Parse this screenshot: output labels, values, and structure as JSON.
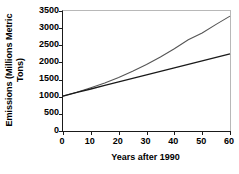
{
  "chart_data": {
    "type": "line",
    "title": "",
    "xlabel": "Years after 1990",
    "ylabel_line1": "Emissions (Millions Metric",
    "ylabel_line2": "Tons)",
    "ylabel": "Emissions (Millions Metric Tons)",
    "xlim": [
      0,
      60
    ],
    "ylim": [
      0,
      3500
    ],
    "xticks": [
      0,
      10,
      20,
      30,
      40,
      50,
      60
    ],
    "xtick_labels": [
      "0",
      "10",
      "20",
      "30",
      "40",
      "50",
      "60"
    ],
    "yticks": [
      0,
      500,
      1000,
      1500,
      2000,
      2500,
      3000,
      3500
    ],
    "ytick_labels": [
      "0",
      "500",
      "1000",
      "1500",
      "2000",
      "2500",
      "3000",
      "3500"
    ],
    "grid": false,
    "legend": "none",
    "x": [
      0,
      5,
      10,
      15,
      20,
      25,
      30,
      35,
      40,
      45,
      50,
      55,
      60
    ],
    "series": [
      {
        "name": "exponential-growth",
        "color": "#555555",
        "values": [
          1020,
          1130,
          1260,
          1400,
          1560,
          1740,
          1940,
          2160,
          2400,
          2660,
          2860,
          3110,
          3350
        ]
      },
      {
        "name": "linear-growth",
        "color": "#1a1a1a",
        "values": [
          1020,
          1125,
          1225,
          1330,
          1430,
          1535,
          1635,
          1740,
          1840,
          1945,
          2045,
          2150,
          2250
        ]
      }
    ]
  },
  "axes": {
    "frame_color": "#b8b8b8",
    "axis_color": "#1a1a1a"
  }
}
